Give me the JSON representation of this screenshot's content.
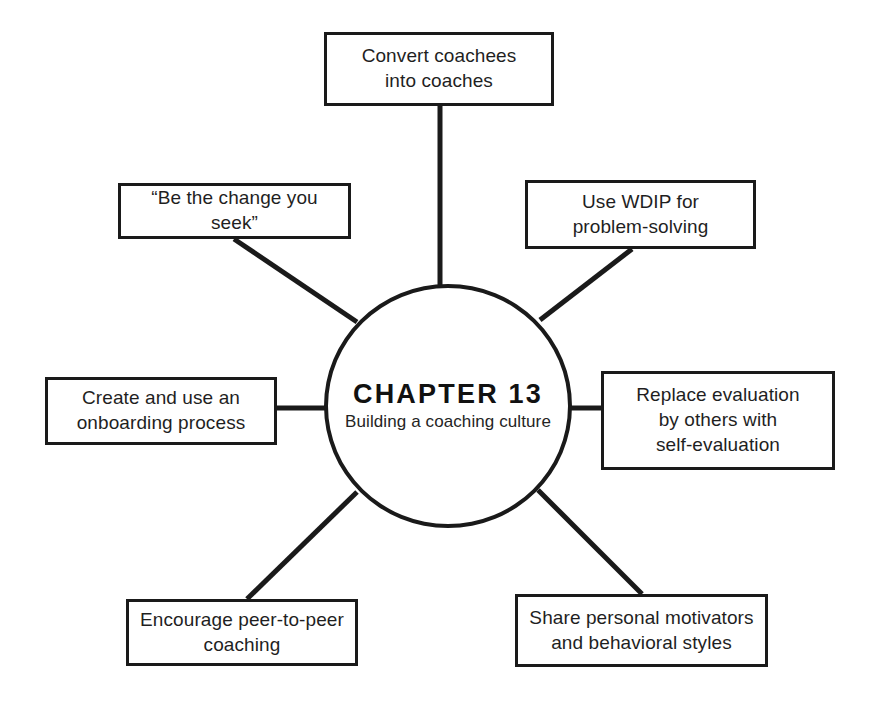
{
  "diagram": {
    "type": "hub-and-spoke",
    "center": {
      "title": "CHAPTER 13",
      "subtitle": "Building a coaching culture"
    },
    "nodes": [
      {
        "id": "top",
        "label": "Convert coachees\ninto coaches",
        "position": "top"
      },
      {
        "id": "upper-left",
        "label": "“Be the change you seek”",
        "position": "upper-left"
      },
      {
        "id": "upper-right",
        "label": "Use WDIP for\nproblem-solving",
        "position": "upper-right"
      },
      {
        "id": "left",
        "label": "Create and use an\nonboarding process",
        "position": "left"
      },
      {
        "id": "right",
        "label": "Replace evaluation\nby others with\nself-evaluation",
        "position": "right"
      },
      {
        "id": "lower-left",
        "label": "Encourage peer-to-peer\ncoaching",
        "position": "lower-left"
      },
      {
        "id": "lower-right",
        "label": "Share personal motivators\nand behavioral styles",
        "position": "lower-right"
      }
    ],
    "colors": {
      "stroke": "#1a1a1a",
      "background": "#ffffff",
      "text": "#1f1f1f"
    }
  }
}
